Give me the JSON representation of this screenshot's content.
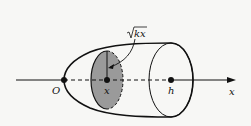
{
  "diagram": {
    "labels": {
      "origin": "O",
      "cross_section_x": "x",
      "end_h": "h",
      "axis": "x",
      "radius": "kx",
      "radius_full": "√kx"
    },
    "colors": {
      "background": "#f7f7f5",
      "stroke": "#111111",
      "shaded": "#9a9a9a"
    }
  }
}
